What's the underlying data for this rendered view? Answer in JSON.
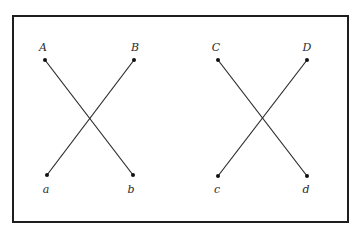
{
  "figure": {
    "frame": {
      "x": 13,
      "y": 16,
      "width": 335,
      "height": 206,
      "color": "#1e1e1e"
    },
    "left_cross": {
      "points": [
        {
          "id": "A",
          "label": "A",
          "x": 45,
          "y": 60,
          "label_x": 43,
          "label_y": 47
        },
        {
          "id": "B",
          "label": "B",
          "x": 134,
          "y": 60,
          "label_x": 135,
          "label_y": 47
        },
        {
          "id": "a",
          "label": "a",
          "x": 47,
          "y": 175,
          "label_x": 46,
          "label_y": 189
        },
        {
          "id": "b",
          "label": "b",
          "x": 133,
          "y": 175,
          "label_x": 131,
          "label_y": 189
        }
      ],
      "connections": [
        [
          "A",
          "b"
        ],
        [
          "B",
          "a"
        ]
      ]
    },
    "right_cross": {
      "points": [
        {
          "id": "C",
          "label": "C",
          "x": 218,
          "y": 60,
          "label_x": 216,
          "label_y": 47
        },
        {
          "id": "D",
          "label": "D",
          "x": 307,
          "y": 60,
          "label_x": 307,
          "label_y": 47
        },
        {
          "id": "c",
          "label": "c",
          "x": 218,
          "y": 176,
          "label_x": 217,
          "label_y": 189
        },
        {
          "id": "d",
          "label": "d",
          "x": 307,
          "y": 176,
          "label_x": 306,
          "label_y": 189
        }
      ],
      "connections": [
        [
          "C",
          "d"
        ],
        [
          "D",
          "c"
        ]
      ]
    },
    "labels": {
      "A": "A",
      "B": "B",
      "a": "a",
      "b": "b",
      "C": "C",
      "D": "D",
      "c": "c",
      "d": "d"
    },
    "caption": "FIGURE"
  }
}
